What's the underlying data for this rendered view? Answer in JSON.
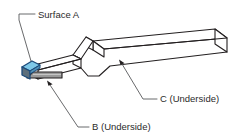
{
  "diagram": {
    "type": "isometric-technical-drawing",
    "background_color": "#ffffff",
    "line_color": "#231f20",
    "leader_color": "#58595b",
    "text_color": "#2b2b2b",
    "surfaces": {
      "a": {
        "label": "Surface A",
        "highlight_color": "#7ec8e8",
        "highlight_edge_color": "#1b4a7a",
        "end_face_color": "#5d6f7c",
        "position": "left angled tip, top face"
      },
      "b": {
        "label": "B (Underside)",
        "highlight_color": "#9a9a9a",
        "highlight_edge_color": "#231f20",
        "position": "underside of left lower arm"
      },
      "c": {
        "label": "C (Underside)",
        "position": "underside of long right arm"
      }
    },
    "labels": [
      {
        "id": "surface-a",
        "text": "Surface A",
        "x": 38,
        "y": 15
      },
      {
        "id": "surface-b",
        "text": "B (Underside)",
        "x": 92,
        "y": 127
      },
      {
        "id": "surface-c",
        "text": "C (Underside)",
        "x": 160,
        "y": 99
      }
    ]
  }
}
